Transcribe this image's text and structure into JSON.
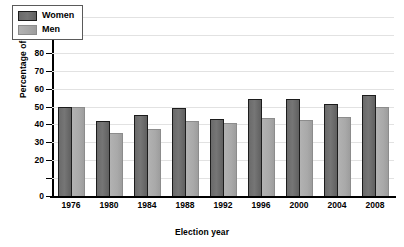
{
  "chart_data": {
    "type": "bar",
    "title": "",
    "xlabel": "Election year",
    "ylabel": "Percentage of voters",
    "categories": [
      "1976",
      "1980",
      "1984",
      "1988",
      "1992",
      "1996",
      "2000",
      "2004",
      "2008"
    ],
    "series": [
      {
        "name": "Women",
        "color": "#6e6e6e",
        "values": [
          50,
          42,
          45,
          49,
          43,
          54,
          54,
          51.5,
          56.5
        ]
      },
      {
        "name": "Men",
        "color": "#aaaaaa",
        "values": [
          50,
          35,
          37.5,
          42,
          41,
          43.5,
          42.5,
          44,
          50
        ]
      }
    ],
    "ylim": [
      0,
      100
    ],
    "ytick_values": [
      0,
      10,
      20,
      30,
      40,
      50,
      60,
      70,
      80,
      90,
      100
    ],
    "ytick_labels": [
      "0",
      "",
      "20",
      "30",
      "40",
      "50",
      "60",
      "70",
      "80",
      "90",
      "100"
    ],
    "grid": true,
    "legend_position": "top-left"
  }
}
